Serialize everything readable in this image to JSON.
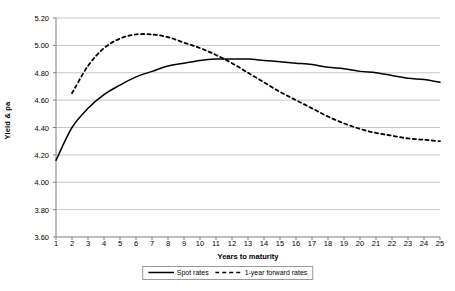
{
  "chart_data": {
    "type": "line",
    "title": "",
    "xlabel": "Years to maturity",
    "ylabel": "Yield & pa",
    "xlim": [
      1,
      25
    ],
    "ylim": [
      3.6,
      5.2
    ],
    "grid": true,
    "legend_position": "bottom",
    "x": [
      1,
      2,
      3,
      4,
      5,
      6,
      7,
      8,
      9,
      10,
      11,
      12,
      13,
      14,
      15,
      16,
      17,
      18,
      19,
      20,
      21,
      22,
      23,
      24,
      25
    ],
    "y_ticks": [
      "3.60",
      "3.80",
      "4.00",
      "4.20",
      "4.40",
      "4.60",
      "4.80",
      "5.00",
      "5.20"
    ],
    "y_tick_values": [
      3.6,
      3.8,
      4.0,
      4.2,
      4.4,
      4.6,
      4.8,
      5.0,
      5.2
    ],
    "x_ticks": [
      "1",
      "2",
      "3",
      "4",
      "5",
      "6",
      "7",
      "8",
      "9",
      "10",
      "11",
      "12",
      "13",
      "14",
      "15",
      "16",
      "17",
      "18",
      "19",
      "20",
      "21",
      "22",
      "23",
      "24",
      "25"
    ],
    "series": [
      {
        "name": "Spot rates",
        "style": "solid",
        "color": "#000000",
        "x": [
          1,
          2,
          3,
          4,
          5,
          6,
          7,
          8,
          9,
          10,
          11,
          12,
          13,
          14,
          15,
          16,
          17,
          18,
          19,
          20,
          21,
          22,
          23,
          24,
          25
        ],
        "values": [
          4.16,
          4.4,
          4.54,
          4.64,
          4.71,
          4.77,
          4.81,
          4.85,
          4.87,
          4.89,
          4.9,
          4.9,
          4.9,
          4.89,
          4.88,
          4.87,
          4.86,
          4.84,
          4.83,
          4.81,
          4.8,
          4.78,
          4.76,
          4.75,
          4.73
        ]
      },
      {
        "name": "1-year forward rates",
        "style": "dashed",
        "color": "#000000",
        "x": [
          2,
          3,
          4,
          5,
          6,
          7,
          8,
          9,
          10,
          11,
          12,
          13,
          14,
          15,
          16,
          17,
          18,
          19,
          20,
          21,
          22,
          23,
          24,
          25
        ],
        "values": [
          4.65,
          4.85,
          4.98,
          5.05,
          5.08,
          5.08,
          5.06,
          5.02,
          4.98,
          4.93,
          4.87,
          4.8,
          4.73,
          4.66,
          4.6,
          4.54,
          4.48,
          4.43,
          4.39,
          4.36,
          4.34,
          4.32,
          4.31,
          4.3
        ]
      }
    ]
  },
  "legend": {
    "entries": [
      {
        "label": "Spot rates"
      },
      {
        "label": "1-year forward rates"
      }
    ]
  }
}
